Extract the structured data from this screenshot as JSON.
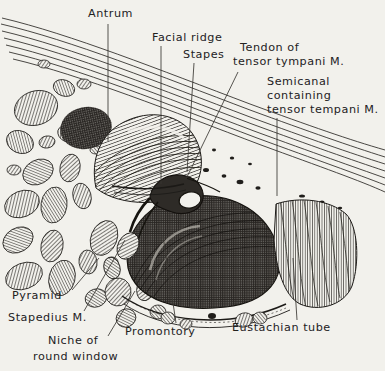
{
  "figure": {
    "style": "pen-and-ink stipple engraving",
    "background_color": "#f2f1ec",
    "ink_color": "#23211e",
    "width": 385,
    "height": 371
  },
  "labels": [
    {
      "id": "antrum",
      "text": "Antrum",
      "x": 88,
      "y": 14,
      "anchor": "start"
    },
    {
      "id": "facial-ridge",
      "text": "Facial ridge",
      "x": 152,
      "y": 38,
      "anchor": "start"
    },
    {
      "id": "stapes",
      "text": "Stapes",
      "x": 183,
      "y": 55,
      "anchor": "start"
    },
    {
      "id": "tendon-1",
      "text": "Tendon of",
      "x": 240,
      "y": 48,
      "anchor": "start"
    },
    {
      "id": "tendon-2",
      "text": "tensor tympani M.",
      "x": 233,
      "y": 62,
      "anchor": "start"
    },
    {
      "id": "semicanal-1",
      "text": "Semicanal",
      "x": 267,
      "y": 82,
      "anchor": "start"
    },
    {
      "id": "semicanal-2",
      "text": "containing",
      "x": 267,
      "y": 96,
      "anchor": "start"
    },
    {
      "id": "semicanal-3",
      "text": "tensor tempani M.",
      "x": 267,
      "y": 110,
      "anchor": "start"
    },
    {
      "id": "pyramid",
      "text": "Pyramid",
      "x": 12,
      "y": 296,
      "anchor": "start"
    },
    {
      "id": "stapedius",
      "text": "Stapedius M.",
      "x": 8,
      "y": 318,
      "anchor": "start"
    },
    {
      "id": "niche-1",
      "text": "Niche of",
      "x": 48,
      "y": 341,
      "anchor": "start"
    },
    {
      "id": "niche-2",
      "text": "round window",
      "x": 33,
      "y": 357,
      "anchor": "start"
    },
    {
      "id": "promontory",
      "text": "Promontory",
      "x": 125,
      "y": 332,
      "anchor": "start"
    },
    {
      "id": "eustachian",
      "text": "Eustachian tube",
      "x": 232,
      "y": 328,
      "anchor": "start"
    }
  ],
  "leaders": [
    {
      "id": "leader-antrum",
      "for": "antrum",
      "path": "M108,24 L108,141"
    },
    {
      "id": "leader-facial-ridge",
      "for": "facial-ridge",
      "path": "M161,46 L161,184"
    },
    {
      "id": "leader-stapes",
      "for": "stapes",
      "path": "M194,63 L187,172"
    },
    {
      "id": "leader-tendon",
      "for": "tendon-1",
      "path": "M238,72 L186,179"
    },
    {
      "id": "leader-semicanal",
      "for": "semicanal-3",
      "path": "M277,118 L277,196"
    },
    {
      "id": "leader-pyramid",
      "for": "pyramid",
      "path": "M72,290 L99,258"
    },
    {
      "id": "leader-stapedius",
      "for": "stapedius",
      "path": "M84,311 L125,240"
    },
    {
      "id": "leader-niche",
      "for": "niche-1",
      "path": "M108,336 L135,291"
    },
    {
      "id": "leader-promontory",
      "for": "promontory",
      "path": "M176,323 L163,236"
    },
    {
      "id": "leader-eustachian",
      "for": "eustachian",
      "path": "M297,320 L293,258"
    }
  ],
  "structures": [
    {
      "id": "tegmen-lines",
      "name": "tegmen tympani line bundle",
      "description": "bundle of seven parallel curved lines sweeping from upper-left to right edge"
    },
    {
      "id": "mastoid-cells",
      "name": "mastoid air cells",
      "description": "field of hatched oval cells filling the left third"
    },
    {
      "id": "antrum-dome",
      "name": "antrum",
      "description": "large hatched dome in the upper-centre"
    },
    {
      "id": "promontory-dome",
      "name": "promontory",
      "description": "large dark stippled dome in the lower-centre"
    },
    {
      "id": "eustachian-bell",
      "name": "eustachian tube orifice",
      "description": "vertically hatched flaring tube at the lower right"
    },
    {
      "id": "stapes-arch",
      "name": "stapes",
      "description": "small stirrup-shaped ossicle at the centre"
    }
  ]
}
